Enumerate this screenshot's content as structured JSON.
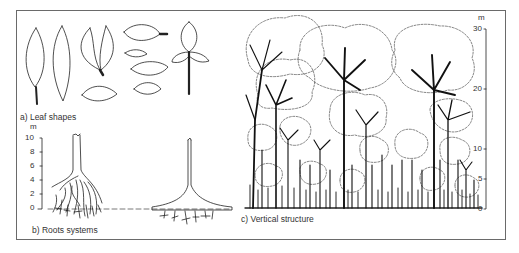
{
  "figure": {
    "panels": [
      {
        "id": "a",
        "caption": "a) Leaf shapes"
      },
      {
        "id": "b",
        "caption": "b) Roots systems"
      },
      {
        "id": "c",
        "caption": "c) Vertical structure"
      }
    ],
    "roots_scale": {
      "unit": "m",
      "ticks": [
        "10",
        "8",
        "6",
        "4",
        "2",
        "0"
      ]
    },
    "vertical_scale": {
      "unit": "m",
      "ticks": [
        "30",
        "20",
        "10",
        "5",
        "0"
      ]
    }
  }
}
